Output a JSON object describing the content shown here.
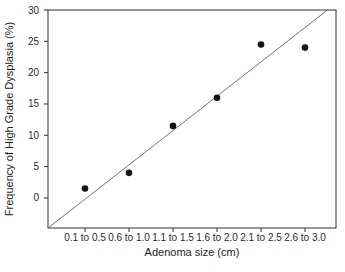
{
  "chart": {
    "background_color": "#ffffff",
    "text_color": "#2a2a2a"
  },
  "chart_data": {
    "type": "scatter",
    "xlabel": "Adenoma size (cm)",
    "ylabel": "Frequency of High Grade Dysplasia (%)",
    "categories": [
      "0.1 to 0.5",
      "0.6 to 1.0",
      "1.1 to 1.5",
      "1.6 to 2.0",
      "2.1 to 2.5",
      "2.6 to 3.0"
    ],
    "values": [
      1.5,
      4,
      11.5,
      16,
      24.5,
      24
    ],
    "y_ticks": [
      0,
      5,
      10,
      15,
      20,
      25,
      30
    ],
    "ylim": [
      -4.8,
      30
    ],
    "grid": false,
    "legend": "none",
    "marker": "filled-circle",
    "trendline": {
      "type": "linear",
      "value_at_first_category": -0.2,
      "slope_per_category": 5.48
    },
    "colors": {
      "axis": "#2e2e2e",
      "point": "#141414",
      "trendline": "#747474"
    }
  }
}
